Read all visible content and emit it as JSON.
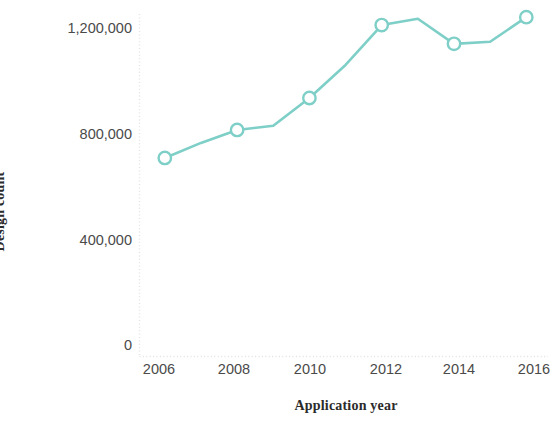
{
  "chart_data": {
    "type": "line",
    "title": "",
    "subtitle": "",
    "xlabel": "Application year",
    "ylabel": "Design count",
    "x": [
      2006,
      2007,
      2008,
      2009,
      2010,
      2011,
      2012,
      2013,
      2014,
      2015,
      2016
    ],
    "values": [
      708000,
      765000,
      814000,
      830000,
      935000,
      1060000,
      1211000,
      1235000,
      1140000,
      1148000,
      1241000
    ],
    "series": [
      {
        "name": "Design count",
        "values": [
          708000,
          765000,
          814000,
          830000,
          935000,
          1060000,
          1211000,
          1235000,
          1140000,
          1148000,
          1241000
        ]
      }
    ],
    "marked_points": [
      {
        "x": 2006,
        "y": 708000
      },
      {
        "x": 2008,
        "y": 814000
      },
      {
        "x": 2010,
        "y": 935000
      },
      {
        "x": 2012,
        "y": 1211000
      },
      {
        "x": 2014,
        "y": 1140000
      },
      {
        "x": 2016,
        "y": 1241000
      }
    ],
    "xlim": [
      2005.3,
      2016.6
    ],
    "ylim": [
      0,
      1270000
    ],
    "xticks": [
      2006,
      2008,
      2010,
      2012,
      2014,
      2016
    ],
    "xtick_labels": [
      "2006",
      "2008",
      "2010",
      "2012",
      "2014",
      "2016"
    ],
    "yticks": [
      0,
      400000,
      800000,
      1200000
    ],
    "ytick_labels": [
      "0",
      "400,000",
      "800,000",
      "1,200,000"
    ],
    "grid": false,
    "legend": null,
    "legend_position": "none",
    "annotations": [],
    "colors": {
      "series_line": "#7ecfc7",
      "marker_fill": "#ffffff",
      "marker_stroke": "#7ecfc7",
      "axis": "#e2e2e2",
      "tick_text": "#4a4a4a",
      "axis_title_text": "#2b2b2b",
      "background": "#ffffff"
    }
  }
}
